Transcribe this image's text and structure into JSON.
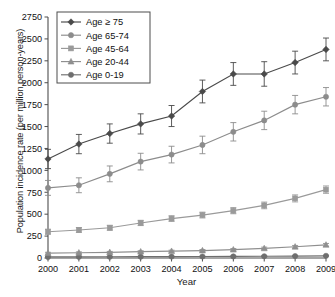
{
  "chart_data": {
    "type": "line",
    "title": "",
    "xlabel": "Year",
    "ylabel": "Population incidence rate (per million person-years)",
    "x": [
      2000,
      2001,
      2002,
      2003,
      2004,
      2005,
      2006,
      2007,
      2008,
      2009
    ],
    "xticklabels": [
      "2000",
      "2001",
      "2002",
      "2003",
      "2004",
      "2005",
      "2006",
      "2007",
      "2008",
      "2009"
    ],
    "yticks": [
      0,
      250,
      500,
      750,
      1000,
      1250,
      1500,
      1750,
      2000,
      2250,
      2500,
      2750
    ],
    "yticklabels": [
      "0",
      "250",
      "500",
      "750",
      "1000",
      "1250",
      "1500",
      "1750",
      "2000",
      "2250",
      "2500",
      "2750"
    ],
    "ylim": [
      0,
      2750
    ],
    "xlim": [
      2000,
      2009
    ],
    "grid": false,
    "legend_position": "top-left",
    "error_bars": true,
    "series": [
      {
        "name": "Age ≥ 75",
        "marker": "diamond",
        "color": "#4a4a4a",
        "values": [
          1130,
          1300,
          1420,
          1530,
          1620,
          1900,
          2100,
          2100,
          2230,
          2380
        ],
        "err_low": [
          110,
          110,
          110,
          115,
          120,
          130,
          130,
          140,
          130,
          130
        ],
        "err_high": [
          110,
          110,
          110,
          115,
          120,
          130,
          130,
          140,
          130,
          130
        ]
      },
      {
        "name": "Age 65-74",
        "marker": "circle",
        "color": "#8c8c8c",
        "values": [
          800,
          830,
          960,
          1100,
          1180,
          1290,
          1440,
          1570,
          1750,
          1840
        ],
        "err_low": [
          85,
          85,
          90,
          95,
          95,
          100,
          105,
          105,
          105,
          105
        ],
        "err_high": [
          85,
          85,
          90,
          95,
          95,
          100,
          105,
          105,
          105,
          105
        ]
      },
      {
        "name": "Age 45-64",
        "marker": "square",
        "color": "#9a9a9a",
        "values": [
          300,
          320,
          345,
          400,
          450,
          490,
          540,
          600,
          680,
          780
        ],
        "err_low": [
          28,
          28,
          28,
          30,
          32,
          33,
          35,
          38,
          40,
          42
        ],
        "err_high": [
          28,
          28,
          28,
          30,
          32,
          33,
          35,
          38,
          40,
          42
        ]
      },
      {
        "name": "Age 20-44",
        "marker": "triangle",
        "color": "#8f8f8f",
        "values": [
          55,
          60,
          65,
          72,
          78,
          85,
          95,
          110,
          128,
          150
        ],
        "err_low": [
          10,
          10,
          10,
          11,
          11,
          12,
          13,
          14,
          15,
          16
        ],
        "err_high": [
          10,
          10,
          10,
          11,
          11,
          12,
          13,
          14,
          15,
          16
        ]
      },
      {
        "name": "Age 0-19",
        "marker": "circle",
        "color": "#6e6e6e",
        "values": [
          12,
          13,
          14,
          15,
          16,
          17,
          18,
          20,
          22,
          25
        ],
        "err_low": [
          4,
          4,
          4,
          4,
          4,
          4,
          5,
          5,
          5,
          5
        ],
        "err_high": [
          4,
          4,
          4,
          4,
          4,
          4,
          5,
          5,
          5,
          5
        ]
      }
    ]
  }
}
